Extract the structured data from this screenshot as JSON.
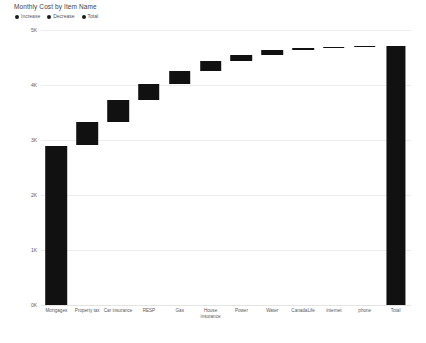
{
  "chart_data": {
    "type": "bar",
    "chart_style": "waterfall",
    "title": "Monthly Cost by Item Name",
    "xlabel": "",
    "ylabel": "",
    "ylim": [
      0,
      5000
    ],
    "grid": true,
    "legend_position": "top-left",
    "ytick_labels": [
      "5K",
      "4K",
      "3K",
      "2K",
      "1K",
      "0K"
    ],
    "ytick_values": [
      5000,
      4000,
      3000,
      2000,
      1000,
      0
    ],
    "legend": [
      {
        "label": "Increase",
        "color": "#1a1a1a"
      },
      {
        "label": "Decrease",
        "color": "#1a1a1a"
      },
      {
        "label": "Total",
        "color": "#1a1a1a"
      }
    ],
    "categories": [
      "Mortgages",
      "Property tax",
      "Car insurance",
      "RESP",
      "Gas",
      "House insurance",
      "Power",
      "Water",
      "CanadaLife",
      "internet",
      "phone",
      "Total"
    ],
    "bars": [
      {
        "category": "Mortgages",
        "kind": "increase",
        "value": 2900,
        "start": 0,
        "end": 2900
      },
      {
        "category": "Property tax",
        "kind": "increase",
        "value": 430,
        "start": 2900,
        "end": 3330
      },
      {
        "category": "Car insurance",
        "kind": "increase",
        "value": 390,
        "start": 3330,
        "end": 3720
      },
      {
        "category": "RESP",
        "kind": "increase",
        "value": 300,
        "start": 3720,
        "end": 4020
      },
      {
        "category": "Gas",
        "kind": "increase",
        "value": 230,
        "start": 4020,
        "end": 4250
      },
      {
        "category": "House insurance",
        "kind": "increase",
        "value": 180,
        "start": 4250,
        "end": 4430
      },
      {
        "category": "Power",
        "kind": "increase",
        "value": 120,
        "start": 4430,
        "end": 4550
      },
      {
        "category": "Water",
        "kind": "increase",
        "value": 80,
        "start": 4550,
        "end": 4630
      },
      {
        "category": "CanadaLife",
        "kind": "increase",
        "value": 40,
        "start": 4630,
        "end": 4670
      },
      {
        "category": "internet",
        "kind": "increase",
        "value": 25,
        "start": 4670,
        "end": 4695
      },
      {
        "category": "phone",
        "kind": "increase",
        "value": 20,
        "start": 4695,
        "end": 4715
      },
      {
        "category": "Total",
        "kind": "total",
        "value": 4715,
        "start": 0,
        "end": 4715
      }
    ]
  }
}
